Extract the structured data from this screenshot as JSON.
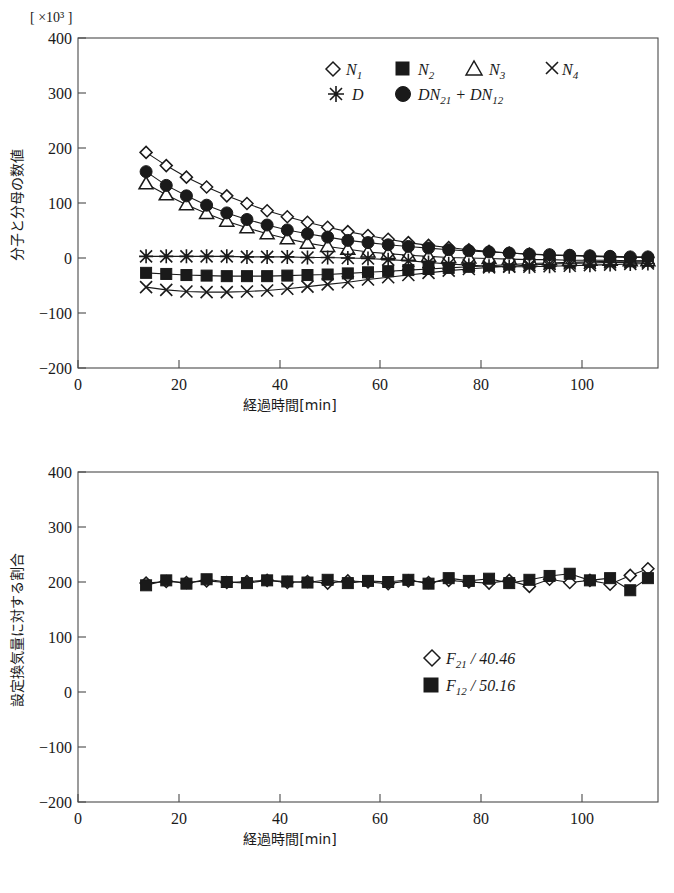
{
  "figure": {
    "name": "two-panel-time-series-figure"
  },
  "chart_data": [
    {
      "id": "top",
      "type": "line",
      "title": "",
      "unit_label": "[ ×10³ ]",
      "xlabel": "経過時間[min]",
      "ylabel": "分子と分母の数値",
      "xlim": [
        0,
        115
      ],
      "ylim": [
        -200,
        400
      ],
      "xticks": [
        0,
        20,
        40,
        60,
        80,
        100
      ],
      "yticks": [
        400,
        300,
        200,
        100,
        0,
        -100,
        -200
      ],
      "xtick_labels": [
        "0",
        "20",
        "40",
        "60",
        "80",
        "100"
      ],
      "ytick_labels": [
        "400",
        "300",
        "200",
        "100",
        "0",
        "−100",
        "−200"
      ],
      "grid": false,
      "legend_position": "upper-center",
      "legend": [
        {
          "marker": "diamond-open",
          "label": "N",
          "subscript": "1"
        },
        {
          "marker": "square-filled",
          "label": "N",
          "subscript": "2"
        },
        {
          "marker": "triangle-open",
          "label": "N",
          "subscript": "3"
        },
        {
          "marker": "cross-x",
          "label": "N",
          "subscript": "4"
        },
        {
          "marker": "asterisk",
          "label": "D",
          "subscript": ""
        },
        {
          "marker": "circle-filled",
          "label": "DN21 + DN12",
          "subscript": ""
        }
      ],
      "x": [
        13.5,
        17.5,
        21.5,
        25.5,
        29.5,
        33.5,
        37.5,
        41.5,
        45.5,
        49.5,
        53.5,
        57.5,
        61.5,
        65.5,
        69.5,
        73.5,
        77.5,
        81.5,
        85.5,
        89.5,
        93.5,
        97.5,
        101.5,
        105.5,
        109.5,
        113
      ],
      "series": [
        {
          "name": "N1",
          "marker": "diamond-open",
          "values": [
            192,
            168,
            147,
            129,
            113,
            99,
            86,
            75,
            65,
            56,
            48,
            41,
            34,
            28,
            23,
            19,
            15,
            12,
            9,
            7,
            5,
            4,
            3,
            2,
            1,
            1
          ]
        },
        {
          "name": "N2",
          "marker": "square-filled",
          "values": [
            -27,
            -29,
            -31,
            -32,
            -33,
            -33,
            -33,
            -32,
            -31,
            -30,
            -28,
            -26,
            -24,
            -22,
            -20,
            -18,
            -16,
            -14,
            -12,
            -10,
            -9,
            -8,
            -7,
            -6,
            -6,
            -5
          ]
        },
        {
          "name": "N3",
          "marker": "triangle-open",
          "values": [
            135,
            115,
            97,
            81,
            67,
            55,
            44,
            35,
            27,
            21,
            16,
            11,
            8,
            5,
            3,
            1,
            0,
            -1,
            -2,
            -3,
            -3,
            -4,
            -4,
            -4,
            -5,
            -5
          ]
        },
        {
          "name": "N4",
          "marker": "cross-x",
          "values": [
            -53,
            -58,
            -61,
            -62,
            -62,
            -61,
            -59,
            -56,
            -52,
            -48,
            -44,
            -39,
            -35,
            -31,
            -27,
            -23,
            -20,
            -17,
            -15,
            -13,
            -11,
            -10,
            -9,
            -8,
            -8,
            -7
          ]
        },
        {
          "name": "D",
          "marker": "asterisk",
          "values": [
            3,
            3,
            3,
            3,
            3,
            2,
            2,
            2,
            1,
            1,
            0,
            -1,
            -3,
            -5,
            -8,
            -11,
            -13,
            -15,
            -16,
            -16,
            -15,
            -14,
            -13,
            -12,
            -11,
            -10
          ]
        },
        {
          "name": "DN21+DN12",
          "marker": "circle-filled",
          "values": [
            157,
            132,
            113,
            96,
            82,
            70,
            60,
            51,
            44,
            38,
            32,
            28,
            24,
            21,
            18,
            15,
            13,
            11,
            9,
            7,
            6,
            5,
            4,
            3,
            2,
            2
          ]
        }
      ]
    },
    {
      "id": "bottom",
      "type": "line",
      "title": "",
      "unit_label": "",
      "xlabel": "経過時間[min]",
      "ylabel": "設定換気量に対する割合",
      "xlim": [
        0,
        115
      ],
      "ylim": [
        -200,
        400
      ],
      "xticks": [
        0,
        20,
        40,
        60,
        80,
        100
      ],
      "yticks": [
        400,
        300,
        200,
        100,
        0,
        -100,
        -200
      ],
      "xtick_labels": [
        "0",
        "20",
        "40",
        "60",
        "80",
        "100"
      ],
      "ytick_labels": [
        "400",
        "300",
        "200",
        "100",
        "0",
        "−100",
        "−200"
      ],
      "grid": false,
      "legend_position": "lower-right",
      "legend": [
        {
          "marker": "diamond-open",
          "label": "F21 / 40.46",
          "subscript": "21"
        },
        {
          "marker": "square-filled",
          "label": "F12 / 50.16",
          "subscript": "12"
        }
      ],
      "x": [
        13.5,
        17.5,
        21.5,
        25.5,
        29.5,
        33.5,
        37.5,
        41.5,
        45.5,
        49.5,
        53.5,
        57.5,
        61.5,
        65.5,
        69.5,
        73.5,
        77.5,
        81.5,
        85.5,
        89.5,
        93.5,
        97.5,
        101.5,
        105.5,
        109.5,
        113
      ],
      "series": [
        {
          "name": "F21/40.46",
          "marker": "diamond-open",
          "values": [
            198,
            201,
            199,
            202,
            199,
            201,
            203,
            199,
            201,
            198,
            202,
            200,
            197,
            202,
            199,
            203,
            200,
            198,
            203,
            192,
            205,
            199,
            203,
            196,
            212,
            224
          ]
        },
        {
          "name": "F12/50.16",
          "marker": "square-filled",
          "values": [
            194,
            203,
            197,
            205,
            200,
            198,
            203,
            201,
            199,
            204,
            198,
            202,
            200,
            204,
            197,
            207,
            202,
            206,
            198,
            204,
            211,
            215,
            203,
            207,
            185,
            207
          ]
        }
      ]
    }
  ]
}
